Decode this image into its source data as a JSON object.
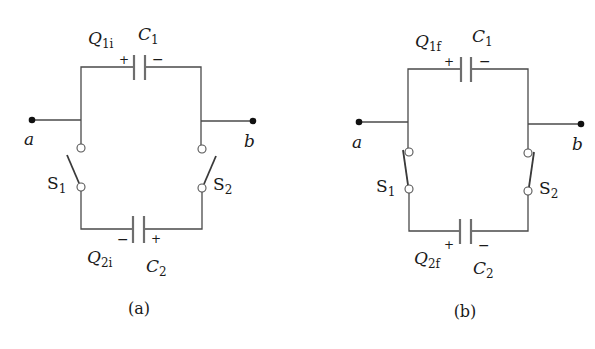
{
  "figure": {
    "panels": [
      {
        "id": "a",
        "caption": "(a)",
        "top_capacitor": {
          "name": "C",
          "sub": "1",
          "charge_label": "Q",
          "charge_sub": "1i",
          "left_sign": "+",
          "right_sign": "−"
        },
        "bottom_capacitor": {
          "name": "C",
          "sub": "2",
          "charge_label": "Q",
          "charge_sub": "2i",
          "left_sign": "−",
          "right_sign": "+"
        },
        "switch_left": {
          "name": "S",
          "sub": "1",
          "state": "open"
        },
        "switch_right": {
          "name": "S",
          "sub": "2",
          "state": "open"
        },
        "terminal_left": "a",
        "terminal_right": "b"
      },
      {
        "id": "b",
        "caption": "(b)",
        "top_capacitor": {
          "name": "C",
          "sub": "1",
          "charge_label": "Q",
          "charge_sub": "1f",
          "left_sign": "+",
          "right_sign": "−"
        },
        "bottom_capacitor": {
          "name": "C",
          "sub": "2",
          "charge_label": "Q",
          "charge_sub": "2f",
          "left_sign": "+",
          "right_sign": "−"
        },
        "switch_left": {
          "name": "S",
          "sub": "1",
          "state": "closed"
        },
        "switch_right": {
          "name": "S",
          "sub": "2",
          "state": "closed"
        },
        "terminal_left": "a",
        "terminal_right": "b"
      }
    ],
    "colors": {
      "wire": "#4a4a4a",
      "plate": "#6e6e6e",
      "text": "#1a1a1a",
      "background": "#ffffff"
    }
  }
}
